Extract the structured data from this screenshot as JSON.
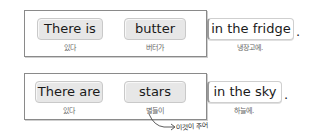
{
  "rows": [
    {
      "subject_verb": {
        "en": "There is",
        "ko": "있다"
      },
      "subject": {
        "en": "butter",
        "ko": "버터가"
      },
      "place": {
        "en": "in the fridge",
        "ko": "냉장고에."
      },
      "period": "."
    },
    {
      "subject_verb": {
        "en": "There are",
        "ko": "있다"
      },
      "subject": {
        "en": "stars",
        "ko": "별들이"
      },
      "place": {
        "en": "in the sky",
        "ko": "하늘에."
      },
      "period": "."
    }
  ],
  "annotation": {
    "text": "이것이 주어",
    "points_to": "stars"
  },
  "colors": {
    "pill_bg": "#e7e7e7",
    "frame_border": "#8a8a8a",
    "korean_text": "#666666"
  }
}
